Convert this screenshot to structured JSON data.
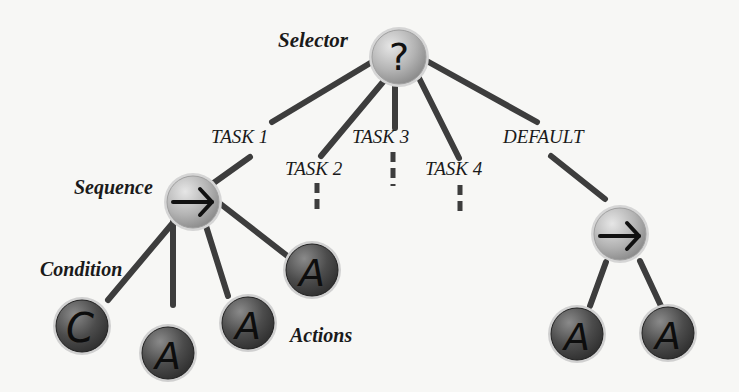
{
  "diagram": {
    "colors": {
      "edge": "#3d3d3d",
      "composite_node_fill": "#b9b9b9",
      "leaf_node_fill": "#4a4a4a",
      "node_ring": "#d8d8d8",
      "label_text": "#1a1a1a"
    },
    "labels": {
      "selector": "Selector",
      "sequence": "Sequence",
      "condition": "Condition",
      "actions": "Actions",
      "task1": "TASK 1",
      "task2": "TASK 2",
      "task3": "TASK 3",
      "task4": "TASK 4",
      "default": "DEFAULT"
    },
    "nodes": [
      {
        "id": "selector",
        "glyph": "?",
        "type": "selector"
      },
      {
        "id": "sequence-left",
        "glyph": "→",
        "type": "sequence"
      },
      {
        "id": "sequence-right",
        "glyph": "→",
        "type": "sequence"
      },
      {
        "id": "condition",
        "glyph": "C",
        "type": "condition"
      },
      {
        "id": "action-1",
        "glyph": "A",
        "type": "action"
      },
      {
        "id": "action-2",
        "glyph": "A",
        "type": "action"
      },
      {
        "id": "action-3",
        "glyph": "A",
        "type": "action"
      },
      {
        "id": "action-4",
        "glyph": "A",
        "type": "action"
      },
      {
        "id": "action-5",
        "glyph": "A",
        "type": "action"
      }
    ],
    "edges": [
      {
        "from": "selector",
        "to": "sequence-left",
        "label": "TASK 1"
      },
      {
        "from": "selector",
        "to": "task2-stub",
        "label": "TASK 2",
        "style": "dashed"
      },
      {
        "from": "selector",
        "to": "task3-stub",
        "label": "TASK 3",
        "style": "dashed"
      },
      {
        "from": "selector",
        "to": "task4-stub",
        "label": "TASK 4",
        "style": "dashed"
      },
      {
        "from": "selector",
        "to": "sequence-right",
        "label": "DEFAULT"
      },
      {
        "from": "sequence-left",
        "to": "condition"
      },
      {
        "from": "sequence-left",
        "to": "action-1"
      },
      {
        "from": "sequence-left",
        "to": "action-2"
      },
      {
        "from": "sequence-left",
        "to": "action-3"
      },
      {
        "from": "sequence-right",
        "to": "action-4"
      },
      {
        "from": "sequence-right",
        "to": "action-5"
      }
    ]
  }
}
